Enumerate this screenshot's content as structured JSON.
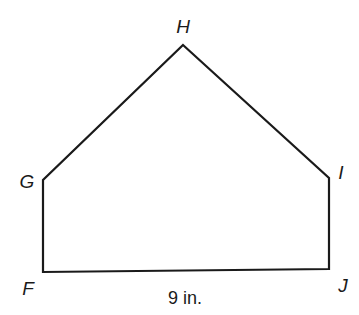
{
  "diagram": {
    "type": "pentagon",
    "stroke_color": "#1a1a1a",
    "background": "#ffffff",
    "vertices": [
      {
        "name": "H",
        "x": 183,
        "y": 45,
        "label": "H",
        "label_x": 183,
        "label_y": 33
      },
      {
        "name": "I",
        "x": 329,
        "y": 178,
        "label": "I",
        "label_x": 341,
        "label_y": 179
      },
      {
        "name": "J",
        "x": 329,
        "y": 269,
        "label": "J",
        "label_x": 343,
        "label_y": 292
      },
      {
        "name": "F",
        "x": 43,
        "y": 272,
        "label": "F",
        "label_x": 28,
        "label_y": 295
      },
      {
        "name": "G",
        "x": 43,
        "y": 180,
        "label": "G",
        "label_x": 27,
        "label_y": 188
      }
    ],
    "measurement": {
      "side": "FJ",
      "text": "9 in.",
      "x": 185,
      "y": 304
    }
  }
}
